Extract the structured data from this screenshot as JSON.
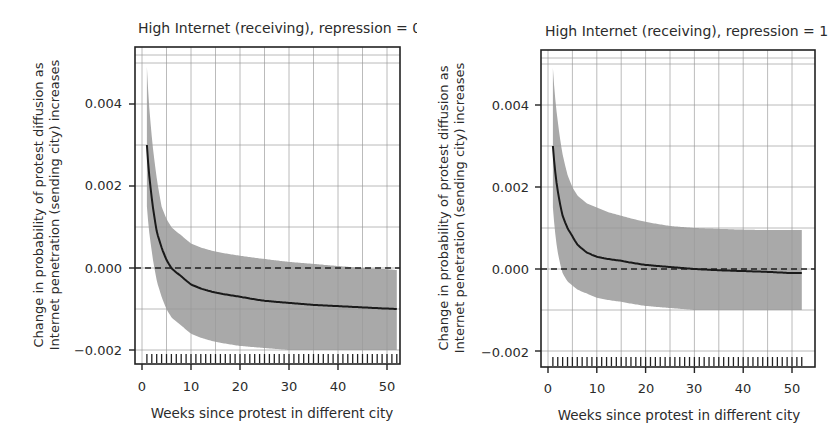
{
  "chart_data": [
    {
      "type": "line",
      "title": "High Internet (receiving), repression = 0",
      "xlabel": "Weeks since protest in different city",
      "ylabel": "Change in probability of protest diffusion as Internet penetration (sending city) increases",
      "ylabel_lines": [
        "Change in probability of protest diffusion as",
        "Internet penetration (sending city) increases"
      ],
      "xlim": [
        0,
        53
      ],
      "ylim": [
        -0.0022,
        0.0053
      ],
      "xticks": [
        0,
        10,
        20,
        30,
        40,
        50
      ],
      "xtick_labels": [
        "0",
        "10",
        "20",
        "30",
        "40",
        "50"
      ],
      "yticks": [
        -0.002,
        0.0,
        0.002,
        0.004
      ],
      "ytick_labels": [
        "-0.002",
        "0.000",
        "0.002",
        "0.004"
      ],
      "grid": true,
      "reference_line": {
        "y": 0.0,
        "style": "dashed"
      },
      "rug": "weekly ticks from 1 to 52",
      "x": [
        1,
        2,
        3,
        4,
        5,
        6,
        8,
        10,
        12,
        15,
        20,
        25,
        30,
        35,
        40,
        45,
        50,
        52
      ],
      "series": [
        {
          "name": "estimate",
          "values": [
            0.003,
            0.0017,
            0.0009,
            0.0005,
            0.0002,
            0.0,
            -0.0002,
            -0.0004,
            -0.0005,
            -0.0006,
            -0.0007,
            -0.0008,
            -0.00085,
            -0.0009,
            -0.00093,
            -0.00096,
            -0.00099,
            -0.001
          ]
        },
        {
          "name": "upper_95ci",
          "values": [
            0.0049,
            0.0032,
            0.0022,
            0.0015,
            0.0012,
            0.001,
            0.0008,
            0.0006,
            0.0005,
            0.0004,
            0.0003,
            0.00022,
            0.00015,
            0.0001,
            5e-05,
            0.0,
            -3e-05,
            -5e-05
          ]
        },
        {
          "name": "lower_95ci",
          "values": [
            0.0015,
            0.0004,
            -0.0003,
            -0.0007,
            -0.001,
            -0.0012,
            -0.0014,
            -0.0016,
            -0.0017,
            -0.0018,
            -0.0019,
            -0.00195,
            -0.002,
            -0.002,
            -0.002,
            -0.002,
            -0.002,
            -0.002
          ]
        }
      ]
    },
    {
      "type": "line",
      "title": "High Internet (receiving), repression = 1",
      "xlabel": "Weeks since protest in different city",
      "ylabel": "Change in probability of protest diffusion as Internet penetration (sending city) increases",
      "ylabel_lines": [
        "Change in probability of protest diffusion as",
        "Internet penetration (sending city) increases"
      ],
      "xlim": [
        0,
        53
      ],
      "ylim": [
        -0.0022,
        0.0053
      ],
      "xticks": [
        0,
        10,
        20,
        30,
        40,
        50
      ],
      "xtick_labels": [
        "0",
        "10",
        "20",
        "30",
        "40",
        "50"
      ],
      "yticks": [
        -0.002,
        0.0,
        0.002,
        0.004
      ],
      "ytick_labels": [
        "-0.002",
        "0.000",
        "0.002",
        "0.004"
      ],
      "grid": true,
      "reference_line": {
        "y": 0.0,
        "style": "dashed"
      },
      "rug": "weekly ticks from 1 to 52",
      "x": [
        1,
        2,
        3,
        4,
        5,
        6,
        8,
        10,
        12,
        15,
        20,
        25,
        30,
        35,
        40,
        45,
        50,
        52
      ],
      "series": [
        {
          "name": "estimate",
          "values": [
            0.003,
            0.0019,
            0.0013,
            0.001,
            0.0008,
            0.0006,
            0.0004,
            0.0003,
            0.00025,
            0.0002,
            0.0001,
            5e-05,
            0.0,
            -3e-05,
            -5e-05,
            -7e-05,
            -0.0001,
            -0.0001
          ]
        },
        {
          "name": "upper_95ci",
          "values": [
            0.0049,
            0.0036,
            0.0028,
            0.0023,
            0.002,
            0.0018,
            0.0016,
            0.0015,
            0.0014,
            0.0013,
            0.00115,
            0.00105,
            0.001,
            0.00098,
            0.00096,
            0.00095,
            0.00095,
            0.00095
          ]
        },
        {
          "name": "lower_95ci",
          "values": [
            0.0015,
            0.0004,
            -0.0001,
            -0.0003,
            -0.0004,
            -0.0005,
            -0.0006,
            -0.0007,
            -0.00075,
            -0.0008,
            -0.0009,
            -0.00095,
            -0.001,
            -0.001,
            -0.001,
            -0.001,
            -0.001,
            -0.001
          ]
        }
      ]
    }
  ],
  "panels": [
    {
      "title": "High Internet (receiving), repression = 0",
      "xlabel": "Weeks since protest in different city",
      "ylabel_line1": "Change in probability of protest diffusion as",
      "ylabel_line2": "Internet penetration (sending city) increases",
      "ytick_labels": [
        "0.004",
        "0.002",
        "0.000",
        "−0.002"
      ],
      "xtick_labels": [
        "0",
        "10",
        "20",
        "30",
        "40",
        "50"
      ]
    },
    {
      "title": "High Internet (receiving), repression = 1",
      "xlabel": "Weeks since protest in different city",
      "ylabel_line1": "Change in probability of protest diffusion as",
      "ylabel_line2": "Internet penetration (sending city) increases",
      "ytick_labels": [
        "0.004",
        "0.002",
        "0.000",
        "−0.002"
      ],
      "xtick_labels": [
        "0",
        "10",
        "20",
        "30",
        "40",
        "50"
      ]
    }
  ],
  "colors": {
    "band": "#a9a9a9",
    "line": "#1a1a1a",
    "grid": "#9a9a9a",
    "frame": "#222222",
    "text": "#2b2b2b"
  }
}
